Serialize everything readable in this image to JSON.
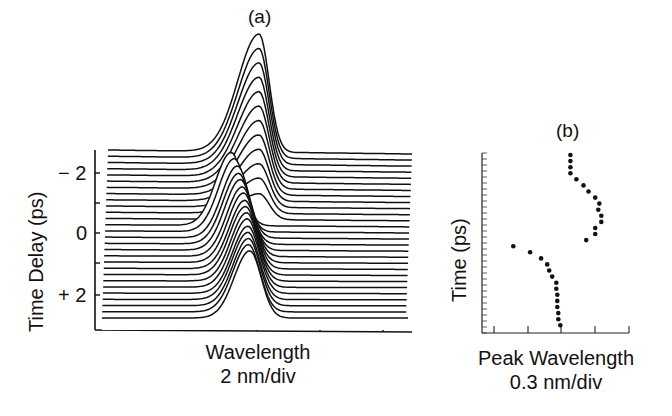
{
  "figure": {
    "panel_a": {
      "label": "(a)",
      "ylabel": "Time Delay (ps)",
      "yticks": [
        "− 2",
        "0",
        "+ 2"
      ],
      "xlabel": "Wavelength",
      "xunit": "2 nm/div"
    },
    "panel_b": {
      "label": "(b)",
      "ylabel": "Time (ps)",
      "xlabel": "Peak Wavelength",
      "xunit": "0.3 nm/div"
    }
  },
  "chart_data": [
    {
      "type": "line",
      "subtype": "waterfall",
      "title": "(a)",
      "xlabel": "Wavelength (2 nm/div)",
      "ylabel": "Time Delay (ps)",
      "yticks": [
        -2,
        0,
        2
      ],
      "ylim": [
        -3,
        3
      ],
      "x_divisions": 5,
      "n_traces": 28,
      "description": "Stacked spectra vs time delay; at early delays (-3 to -1 ps) a single peak grows in amplitude with its maximum near the 3rd x-division, tallest at the top trace; around -0.8 ps the peak abruptly jumps to shorter wavelength and then gradually shifts back toward ~2.9 div as delay increases to +3 ps, with decreasing amplitude.",
      "peak_center_div": [
        3.05,
        3.05,
        3.05,
        3.05,
        3.05,
        3.05,
        3.05,
        3.05,
        3.05,
        3.05,
        3.05,
        3.05,
        2.6,
        2.65,
        2.7,
        2.72,
        2.75,
        2.78,
        2.8,
        2.82,
        2.83,
        2.85,
        2.86,
        2.87,
        2.87,
        2.88,
        2.88,
        2.9
      ],
      "peak_height_rel": [
        1.0,
        0.93,
        0.86,
        0.79,
        0.72,
        0.65,
        0.58,
        0.51,
        0.44,
        0.37,
        0.3,
        0.22,
        0.62,
        0.62,
        0.61,
        0.6,
        0.6,
        0.59,
        0.59,
        0.58,
        0.58,
        0.58,
        0.58,
        0.57,
        0.57,
        0.57,
        0.57,
        0.57
      ]
    },
    {
      "type": "scatter",
      "title": "(b)",
      "xlabel": "Peak Wavelength (0.3 nm/div)",
      "ylabel": "Time (ps)",
      "x_unit": "divisions (0.3 nm each), 0 = left axis",
      "y_order": "top to bottom (index 0 = earliest time)",
      "x": [
        2.66,
        2.66,
        2.66,
        2.66,
        2.84,
        3.05,
        3.2,
        3.4,
        3.52,
        3.49,
        3.58,
        3.58,
        3.4,
        3.4,
        3.13,
        0.96,
        1.46,
        1.79,
        1.97,
        2.03,
        2.12,
        2.24,
        2.24,
        2.27,
        2.27,
        2.27,
        2.3,
        2.3,
        2.36
      ],
      "y_index": [
        0,
        1,
        2,
        3,
        4,
        5,
        6,
        7,
        8,
        9,
        10,
        11,
        12,
        13,
        14,
        15,
        16,
        17,
        18,
        19,
        20,
        21,
        22,
        23,
        24,
        25,
        26,
        27,
        28
      ],
      "xlim": [
        0,
        4.4
      ]
    }
  ]
}
